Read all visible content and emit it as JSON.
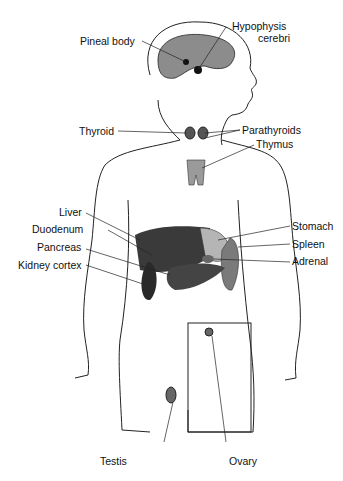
{
  "diagram": {
    "labels": {
      "pineal": "Pineal body",
      "hypophysis_1": "Hypophysis",
      "hypophysis_2": "cerebri",
      "thyroid": "Thyroid",
      "parathyroids": "Parathyroids",
      "thymus": "Thymus",
      "liver": "Liver",
      "duodenum": "Duodenum",
      "pancreas": "Pancreas",
      "kidney_cortex": "Kidney cortex",
      "stomach": "Stomach",
      "spleen": "Spleen",
      "adrenal": "Adrenal",
      "testis": "Testis",
      "ovary": "Ovary"
    },
    "colors": {
      "outline": "#222222",
      "brain": "#8c8c8c",
      "organ_dark": "#3a3a3a",
      "organ_mid": "#7a7a7a",
      "organ_light": "#b5b5b5",
      "thymus": "#9a9a9a"
    }
  }
}
